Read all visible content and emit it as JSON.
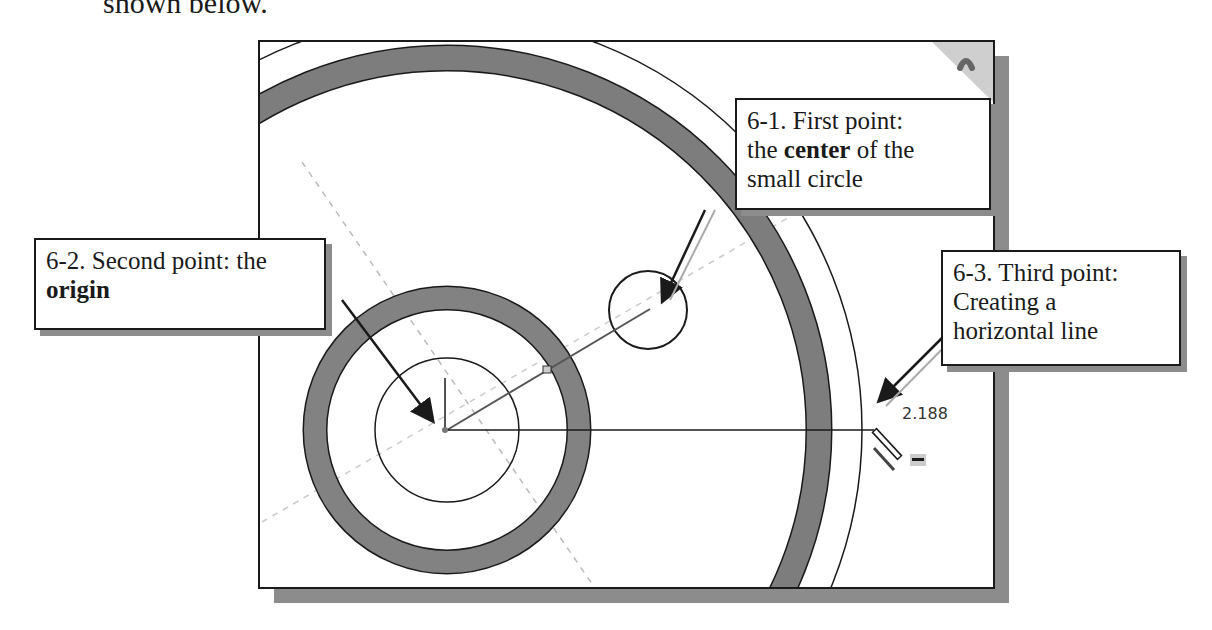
{
  "intro_text": "shown below.",
  "callouts": {
    "first": {
      "prefix": "6-1. First point:",
      "line2_pre": "the ",
      "line2_bold": "center",
      "line2_post": " of the",
      "line3": "small circle"
    },
    "second": {
      "prefix": "6-2. Second point: the",
      "bold": "origin"
    },
    "third": {
      "line1": "6-3. Third point:",
      "line2": "Creating a",
      "line3": "horizontal line"
    }
  },
  "dimension_value": "2.188",
  "icons": {
    "cursor": "pencil-line-cursor-icon",
    "corner": "view-orientation-icon"
  },
  "colors": {
    "outline": "#1a1a1a",
    "ring_fill": "#7d7d7d",
    "shadow": "#8c8c8c"
  }
}
